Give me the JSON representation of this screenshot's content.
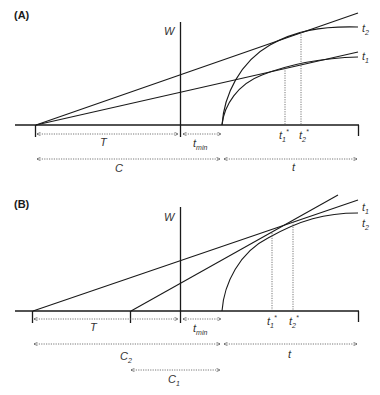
{
  "figure": {
    "panels": [
      {
        "id": "A",
        "label": "(A)",
        "y_axis_label": "W",
        "interval_labels": {
          "T": "T",
          "t_min": "t",
          "t_min_sub": "min",
          "C": "C",
          "t": "t"
        },
        "curve_labels": [
          {
            "name": "t",
            "sub": "2"
          },
          {
            "name": "t",
            "sub": "1"
          }
        ],
        "optimum_labels": [
          {
            "name": "t",
            "sub": "1",
            "sup": "*"
          },
          {
            "name": "t",
            "sub": "2",
            "sup": "*"
          }
        ]
      },
      {
        "id": "B",
        "label": "(B)",
        "y_axis_label": "W",
        "interval_labels": {
          "T": "T",
          "t_min": "t",
          "t_min_sub": "min",
          "C2": "C",
          "C2_sub": "2",
          "C1": "C",
          "C1_sub": "1",
          "t": "t"
        },
        "curve_labels": [
          {
            "name": "t",
            "sub": "1"
          },
          {
            "name": "t",
            "sub": "2"
          }
        ],
        "optimum_labels": [
          {
            "name": "t",
            "sub": "1",
            "sup": "*"
          },
          {
            "name": "t",
            "sub": "2",
            "sup": "*"
          }
        ]
      }
    ]
  }
}
